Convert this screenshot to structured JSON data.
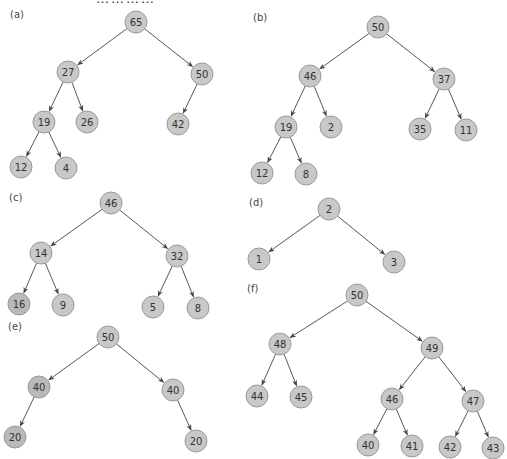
{
  "top_fragment": "…………",
  "style": {
    "node_fill": "#c8c8c8",
    "node_fill_dark": "#b9b9b9",
    "node_stroke": "#9a9a9a",
    "edge_color": "#444444",
    "text_color": "#333333",
    "node_radius": 11
  },
  "trees": [
    {
      "id": "a",
      "label": "(a)",
      "label_pos": [
        10,
        9
      ],
      "nodes": [
        {
          "id": "a0",
          "value": "65",
          "x": 136,
          "y": 22
        },
        {
          "id": "a1",
          "value": "27",
          "x": 68,
          "y": 72
        },
        {
          "id": "a2",
          "value": "50",
          "x": 202,
          "y": 74
        },
        {
          "id": "a3",
          "value": "19",
          "x": 44,
          "y": 122
        },
        {
          "id": "a4",
          "value": "26",
          "x": 87,
          "y": 122
        },
        {
          "id": "a5",
          "value": "42",
          "x": 178,
          "y": 124
        },
        {
          "id": "a6",
          "value": "12",
          "x": 21,
          "y": 167
        },
        {
          "id": "a7",
          "value": "4",
          "x": 66,
          "y": 168
        }
      ],
      "edges": [
        [
          "a0",
          "a1"
        ],
        [
          "a0",
          "a2"
        ],
        [
          "a1",
          "a3"
        ],
        [
          "a1",
          "a4"
        ],
        [
          "a2",
          "a5"
        ],
        [
          "a3",
          "a6"
        ],
        [
          "a3",
          "a7"
        ]
      ]
    },
    {
      "id": "b",
      "label": "(b)",
      "label_pos": [
        253,
        12
      ],
      "nodes": [
        {
          "id": "b0",
          "value": "50",
          "x": 378,
          "y": 27
        },
        {
          "id": "b1",
          "value": "46",
          "x": 310,
          "y": 76
        },
        {
          "id": "b2",
          "value": "37",
          "x": 444,
          "y": 79
        },
        {
          "id": "b3",
          "value": "19",
          "x": 286,
          "y": 127
        },
        {
          "id": "b4",
          "value": "2",
          "x": 331,
          "y": 127
        },
        {
          "id": "b5",
          "value": "35",
          "x": 420,
          "y": 129
        },
        {
          "id": "b6",
          "value": "11",
          "x": 466,
          "y": 130
        },
        {
          "id": "b7",
          "value": "12",
          "x": 262,
          "y": 173
        },
        {
          "id": "b8",
          "value": "8",
          "x": 306,
          "y": 174
        }
      ],
      "edges": [
        [
          "b0",
          "b1"
        ],
        [
          "b0",
          "b2"
        ],
        [
          "b1",
          "b3"
        ],
        [
          "b1",
          "b4"
        ],
        [
          "b2",
          "b5"
        ],
        [
          "b2",
          "b6"
        ],
        [
          "b3",
          "b7"
        ],
        [
          "b3",
          "b8"
        ]
      ]
    },
    {
      "id": "c",
      "label": "(c)",
      "label_pos": [
        9,
        192
      ],
      "nodes": [
        {
          "id": "c0",
          "value": "46",
          "x": 111,
          "y": 203
        },
        {
          "id": "c1",
          "value": "14",
          "x": 41,
          "y": 253
        },
        {
          "id": "c2",
          "value": "32",
          "x": 177,
          "y": 256
        },
        {
          "id": "c3",
          "value": "16",
          "x": 19,
          "y": 304,
          "dark": true
        },
        {
          "id": "c4",
          "value": "9",
          "x": 63,
          "y": 305
        },
        {
          "id": "c5",
          "value": "5",
          "x": 153,
          "y": 307
        },
        {
          "id": "c6",
          "value": "8",
          "x": 198,
          "y": 308
        }
      ],
      "edges": [
        [
          "c0",
          "c1"
        ],
        [
          "c0",
          "c2"
        ],
        [
          "c1",
          "c3"
        ],
        [
          "c1",
          "c4"
        ],
        [
          "c2",
          "c5"
        ],
        [
          "c2",
          "c6"
        ]
      ]
    },
    {
      "id": "d",
      "label": "(d)",
      "label_pos": [
        249,
        197
      ],
      "nodes": [
        {
          "id": "d0",
          "value": "2",
          "x": 329,
          "y": 209
        },
        {
          "id": "d1",
          "value": "1",
          "x": 259,
          "y": 259
        },
        {
          "id": "d2",
          "value": "3",
          "x": 394,
          "y": 262
        }
      ],
      "edges": [
        [
          "d0",
          "d1"
        ],
        [
          "d0",
          "d2"
        ]
      ]
    },
    {
      "id": "e",
      "label": "(e)",
      "label_pos": [
        8,
        321
      ],
      "nodes": [
        {
          "id": "e0",
          "value": "50",
          "x": 108,
          "y": 337
        },
        {
          "id": "e1",
          "value": "40",
          "x": 39,
          "y": 387,
          "dark": true
        },
        {
          "id": "e2",
          "value": "40",
          "x": 173,
          "y": 390
        },
        {
          "id": "e3",
          "value": "20",
          "x": 15,
          "y": 437,
          "dark": true
        },
        {
          "id": "e4",
          "value": "20",
          "x": 196,
          "y": 441
        }
      ],
      "edges": [
        [
          "e0",
          "e1"
        ],
        [
          "e0",
          "e2"
        ],
        [
          "e1",
          "e3"
        ],
        [
          "e2",
          "e4"
        ]
      ]
    },
    {
      "id": "f",
      "label": "(f)",
      "label_pos": [
        247,
        283
      ],
      "nodes": [
        {
          "id": "f0",
          "value": "50",
          "x": 357,
          "y": 295
        },
        {
          "id": "f1",
          "value": "48",
          "x": 280,
          "y": 344
        },
        {
          "id": "f2",
          "value": "49",
          "x": 432,
          "y": 348
        },
        {
          "id": "f3",
          "value": "44",
          "x": 257,
          "y": 396
        },
        {
          "id": "f4",
          "value": "45",
          "x": 301,
          "y": 397
        },
        {
          "id": "f5",
          "value": "46",
          "x": 392,
          "y": 399
        },
        {
          "id": "f6",
          "value": "47",
          "x": 473,
          "y": 401
        },
        {
          "id": "f7",
          "value": "40",
          "x": 368,
          "y": 445
        },
        {
          "id": "f8",
          "value": "41",
          "x": 412,
          "y": 446
        },
        {
          "id": "f9",
          "value": "42",
          "x": 450,
          "y": 447
        },
        {
          "id": "f10",
          "value": "43",
          "x": 493,
          "y": 448
        }
      ],
      "edges": [
        [
          "f0",
          "f1"
        ],
        [
          "f0",
          "f2"
        ],
        [
          "f1",
          "f3"
        ],
        [
          "f1",
          "f4"
        ],
        [
          "f2",
          "f5"
        ],
        [
          "f2",
          "f6"
        ],
        [
          "f5",
          "f7"
        ],
        [
          "f5",
          "f8"
        ],
        [
          "f6",
          "f9"
        ],
        [
          "f6",
          "f10"
        ]
      ]
    }
  ]
}
